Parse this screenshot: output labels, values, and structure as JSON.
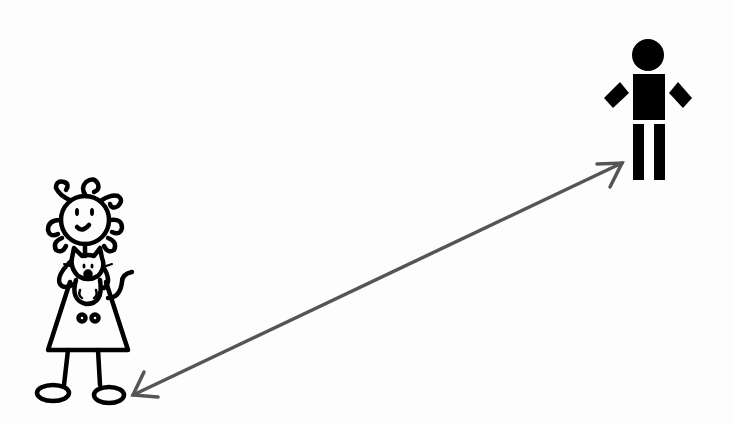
{
  "scene": {
    "width": 733,
    "height": 423,
    "background": "#fdfdfd",
    "figures": [
      {
        "id": "girl",
        "description": "stick-figure girl with curly hair holding a cat",
        "stroke": "#000000"
      },
      {
        "id": "person",
        "description": "blocky pictogram person",
        "fill": "#000000"
      }
    ],
    "arrow": {
      "description": "double-headed arrow between figures",
      "color": "#555555",
      "from": [
        133,
        395
      ],
      "to": [
        622,
        163
      ]
    }
  }
}
